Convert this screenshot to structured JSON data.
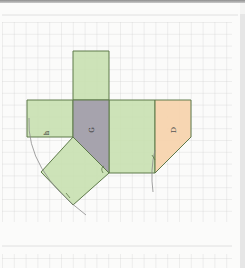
{
  "diagram": {
    "type": "geometric net on grid paper",
    "grid": {
      "cell_size_px": 11.8,
      "line_color": "#cfcfcf",
      "region": {
        "x": 0,
        "y": 22,
        "width": 232,
        "height": 203
      }
    },
    "labels": [
      {
        "id": "h",
        "text": "h",
        "rotation": -90
      },
      {
        "id": "G",
        "text": "G",
        "rotation": -90
      },
      {
        "id": "D",
        "text": "D",
        "rotation": -90
      }
    ],
    "faces": [
      {
        "id": "top-square",
        "color": "#c8e0b0"
      },
      {
        "id": "left-rect-h",
        "color": "#c8e0b0"
      },
      {
        "id": "center-pentagon-G",
        "color": "#a6a3ad"
      },
      {
        "id": "right-rect",
        "color": "#c8e0b0"
      },
      {
        "id": "right-pentagon-D",
        "color": "#f7d4ae"
      },
      {
        "id": "rotated-square",
        "color": "#c8e0b0"
      }
    ],
    "colors": {
      "green_face": "#c8e0b0",
      "grey_face": "#a6a3ad",
      "orange_face": "#f7d4ae",
      "outline": "#5e7a4a",
      "arc": "#8a8a8a"
    }
  }
}
